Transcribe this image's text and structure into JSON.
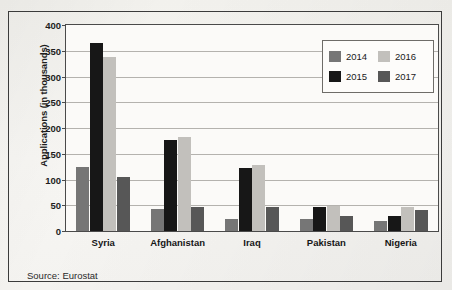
{
  "figure": {
    "source_note": "Source: Eurostat"
  },
  "chart_data": {
    "type": "bar",
    "title": "",
    "xlabel": "",
    "ylabel": "Applications (in thousands)",
    "ylim": [
      0,
      400
    ],
    "ytick_values": [
      0,
      50,
      100,
      150,
      200,
      250,
      300,
      350,
      400
    ],
    "ytick_labels": [
      "0",
      "50",
      "100",
      "150",
      "200",
      "250",
      "300",
      "350",
      "400"
    ],
    "grid": true,
    "legend_position": "top-right",
    "categories": [
      "Syria",
      "Afghanistan",
      "Iraq",
      "Pakistan",
      "Nigeria"
    ],
    "series": [
      {
        "name": "2014",
        "color": "#767676",
        "values": [
          125,
          43,
          23,
          23,
          19
        ]
      },
      {
        "name": "2015",
        "color": "#171717",
        "values": [
          365,
          177,
          123,
          47,
          30
        ]
      },
      {
        "name": "2016",
        "color": "#c2c0bc",
        "values": [
          337,
          183,
          128,
          49,
          47
        ]
      },
      {
        "name": "2017",
        "color": "#575757",
        "values": [
          105,
          46,
          47,
          30,
          41
        ]
      }
    ]
  }
}
